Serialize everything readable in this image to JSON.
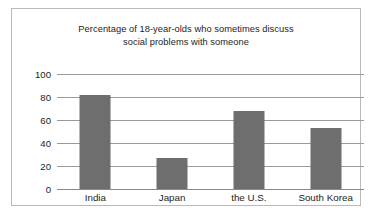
{
  "chart_data": {
    "type": "bar",
    "title": "Percentage of 18-year-olds who sometimes discuss social problems with someone",
    "title_lines": [
      "Percentage of 18-year-olds who sometimes discuss",
      "social problems with someone"
    ],
    "categories": [
      "India",
      "Japan",
      "the U.S.",
      "South Korea"
    ],
    "values": [
      82,
      27,
      68,
      53
    ],
    "xlabel": "",
    "ylabel": "",
    "ylim": [
      0,
      100
    ],
    "yticks": [
      0,
      20,
      40,
      60,
      80,
      100
    ],
    "ytick_labels": [
      "0",
      "20",
      "40",
      "60",
      "80",
      "100"
    ],
    "grid": true,
    "legend": false,
    "bar_color": "#6e6e6e",
    "gridline_color": "#9a9a9a",
    "background_color": "#ffffff",
    "frame_color": "#b9b9b9"
  }
}
